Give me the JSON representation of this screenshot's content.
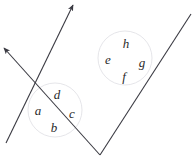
{
  "figure": {
    "width": 193,
    "height": 160,
    "background_color": "#ffffff",
    "line_color": "#3a3a42",
    "circle_color": "#e2e2e6",
    "label_color": "#2b2b2b",
    "line_width": 1.1,
    "circle_width": 0.9
  },
  "lines": [
    {
      "name": "line-1-southwest-northeast",
      "x1": 6,
      "y1": 143,
      "x2": 73,
      "y2": 5,
      "arrow_at": "end",
      "direction": "up-right"
    },
    {
      "name": "line-2-northwest-southeast",
      "x1": 100,
      "y1": 155,
      "x2": 4,
      "y2": 48,
      "arrow_at": "end",
      "direction": "up-left"
    },
    {
      "name": "line-2-extension-northeast",
      "x1": 100,
      "y1": 155,
      "x2": 191,
      "y2": 14,
      "arrow_at": "none",
      "direction": "up-right"
    }
  ],
  "intersections": [
    {
      "name": "lower-intersection",
      "cx": 55,
      "cy": 110,
      "radius": 27
    },
    {
      "name": "upper-intersection",
      "cx": 125,
      "cy": 58,
      "radius": 27
    }
  ],
  "labels": [
    {
      "name": "angle-label-a",
      "text": "a",
      "x": 38,
      "y": 110
    },
    {
      "name": "angle-label-d",
      "text": "d",
      "x": 57,
      "y": 94
    },
    {
      "name": "angle-label-c",
      "text": "c",
      "x": 72,
      "y": 113
    },
    {
      "name": "angle-label-b",
      "text": "b",
      "x": 54,
      "y": 127
    },
    {
      "name": "angle-label-e",
      "text": "e",
      "x": 108,
      "y": 59
    },
    {
      "name": "angle-label-h",
      "text": "h",
      "x": 126,
      "y": 43
    },
    {
      "name": "angle-label-g",
      "text": "g",
      "x": 142,
      "y": 62
    },
    {
      "name": "angle-label-f",
      "text": "f",
      "x": 124,
      "y": 76
    }
  ]
}
